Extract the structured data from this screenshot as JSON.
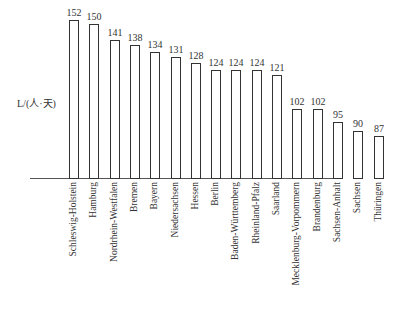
{
  "chart_data": {
    "type": "bar",
    "title": "",
    "xlabel": "",
    "ylabel": "L/(人·天)",
    "categories": [
      "Schleswig-Holstein",
      "Hamburg",
      "Nordrhein-Westfalen",
      "Bremen",
      "Bayern",
      "Niedersachsen",
      "Hessen",
      "Berlin",
      "Baden-Württemberg",
      "Rheinland-Pfalz",
      "Saarland",
      "Mecklenburg-Vorpommern",
      "Brandenburg",
      "Sachsen-Anhalt",
      "Sachsen",
      "Thüringen"
    ],
    "values": [
      152,
      150,
      141,
      138,
      134,
      131,
      128,
      124,
      124,
      124,
      121,
      102,
      102,
      95,
      90,
      87
    ],
    "grid": false,
    "legend": null,
    "data_labels": true
  }
}
